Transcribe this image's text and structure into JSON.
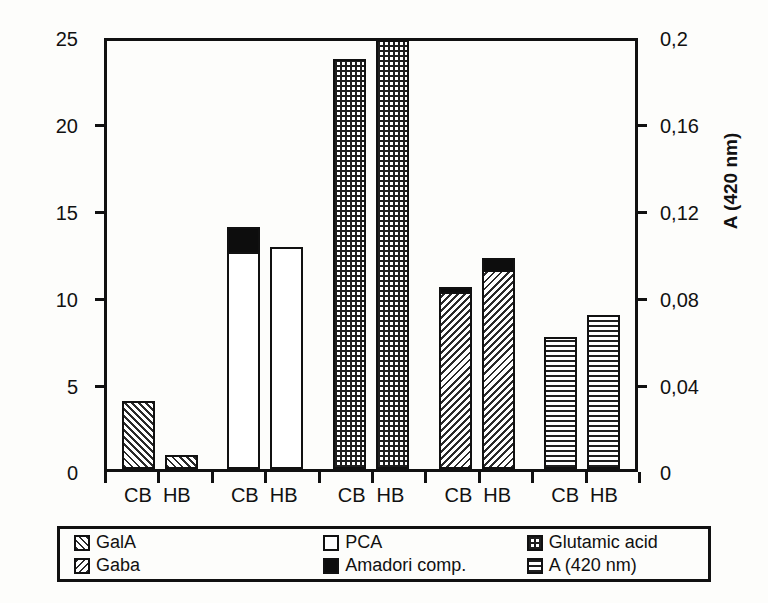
{
  "chart_data": {
    "type": "bar",
    "title": "",
    "subtitle": "",
    "categories": [
      "CB HB",
      "CB HB",
      "CB HB",
      "CB HB",
      "CB HB"
    ],
    "x_tick_labels": [
      "CB",
      "HB",
      "CB",
      "HB",
      "CB",
      "HB",
      "CB",
      "HB",
      "CB",
      "HB"
    ],
    "xlabel": "",
    "ylabel": "mmol/100 g DM",
    "ylabel_right": "A (420 nm)",
    "ylim": [
      0,
      25
    ],
    "ylim_right": [
      0,
      0.2
    ],
    "y_tick_labels": [
      "25",
      "20",
      "15",
      "10",
      "5",
      "0"
    ],
    "y_tick_values": [
      25,
      20,
      15,
      10,
      5,
      0
    ],
    "y_tick_labels_right": [
      "0,2",
      "0,16",
      "0,12",
      "0,08",
      "0,04",
      "0"
    ],
    "y_tick_values_right": [
      0.2,
      0.16,
      0.12,
      0.08,
      0.04,
      0
    ],
    "grid": false,
    "legend_position": "bottom",
    "decimal_separator": ",",
    "legend": [
      {
        "label": "GalA",
        "pattern": "diagonal-forward"
      },
      {
        "label": "PCA",
        "pattern": "empty"
      },
      {
        "label": "Glutamic acid",
        "pattern": "grid"
      },
      {
        "label": "Gaba",
        "pattern": "diagonal-backward"
      },
      {
        "label": "Amadori comp.",
        "pattern": "solid-black"
      },
      {
        "label": "A (420 nm)",
        "pattern": "horizontal-lines"
      }
    ],
    "groups": [
      {
        "name": "GalA",
        "pattern": "diagonal-forward",
        "axis": "left",
        "bars": [
          {
            "label": "CB",
            "value": 3.9,
            "amadori": 0
          },
          {
            "label": "HB",
            "value": 0.8,
            "amadori": 0
          }
        ]
      },
      {
        "name": "PCA",
        "pattern": "empty",
        "axis": "left",
        "bars": [
          {
            "label": "CB",
            "value": 12.6,
            "amadori": 1.6
          },
          {
            "label": "HB",
            "value": 12.8,
            "amadori": 0
          }
        ]
      },
      {
        "name": "Glutamic acid",
        "pattern": "grid",
        "axis": "left",
        "bars": [
          {
            "label": "CB",
            "value": 23.6,
            "amadori": 0
          },
          {
            "label": "HB",
            "value": 24.7,
            "amadori": 0
          }
        ]
      },
      {
        "name": "Gaba",
        "pattern": "diagonal-backward",
        "axis": "left",
        "bars": [
          {
            "label": "CB",
            "value": 10.3,
            "amadori": 0.4
          },
          {
            "label": "HB",
            "value": 11.6,
            "amadori": 0.8
          }
        ]
      },
      {
        "name": "A (420 nm)",
        "pattern": "horizontal-lines",
        "axis": "right",
        "bars": [
          {
            "label": "CB",
            "value": 0.061,
            "amadori": 0
          },
          {
            "label": "HB",
            "value": 0.071,
            "amadori": 0
          }
        ]
      }
    ]
  }
}
